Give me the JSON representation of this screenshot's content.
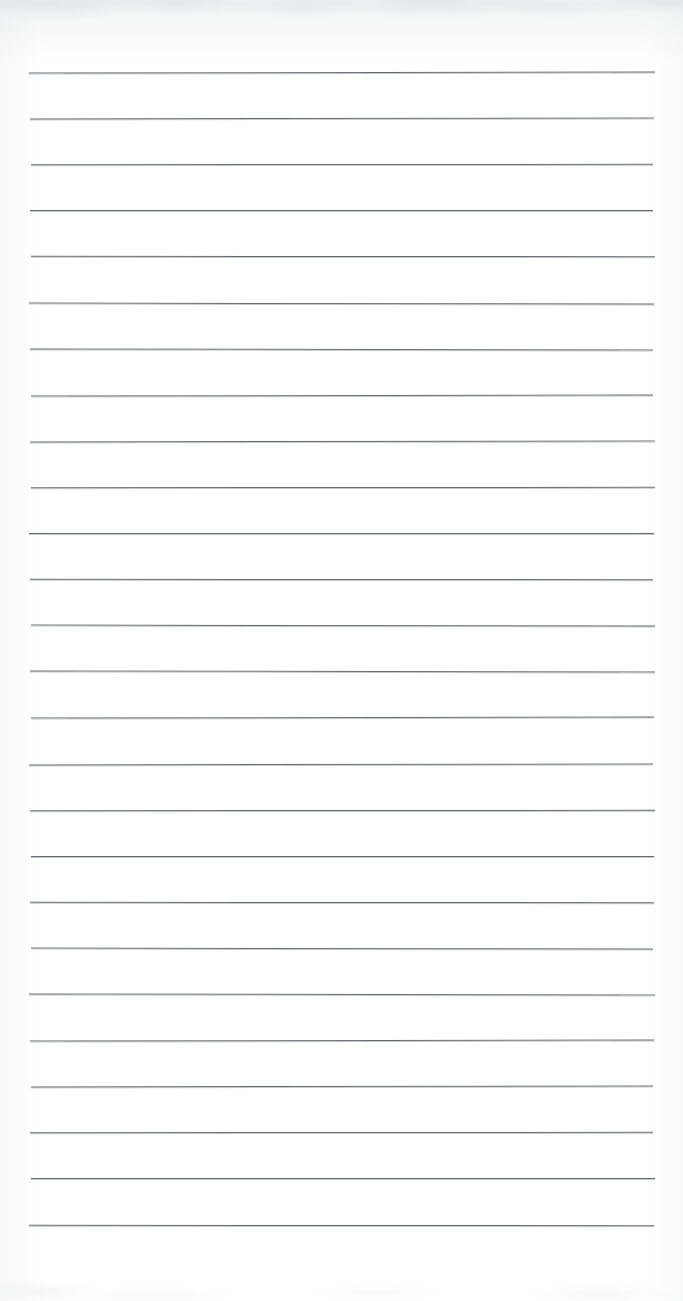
{
  "document": {
    "kind": "scanned-blank-ruled-notebook-page",
    "title": "",
    "page_text": "",
    "handwriting": "",
    "visible_text_items": []
  },
  "page": {
    "width": 683,
    "height": 1301,
    "background_color": "#ffffff",
    "paper_tone": "#ffffff"
  },
  "ruling": {
    "line_count": 26,
    "line_color": "#5d6065",
    "line_thickness_px": 1,
    "first_line_y": 72,
    "line_spacing_px": 46.1,
    "left_margin_x": 29,
    "right_margin_x": 655,
    "line_length_px": 626,
    "top_margin_px": 72,
    "bottom_margin_px": 75,
    "margin_rule": "none",
    "orientation": "portrait"
  },
  "scan_artifacts": {
    "top_haze": "faint grey mottling along upper edge",
    "edge_shading": "subtle grey falloff at left and right edges",
    "bottom_speckle": "very faint grey speckle near bottom edge",
    "haze_color": "#a0a4aa"
  }
}
